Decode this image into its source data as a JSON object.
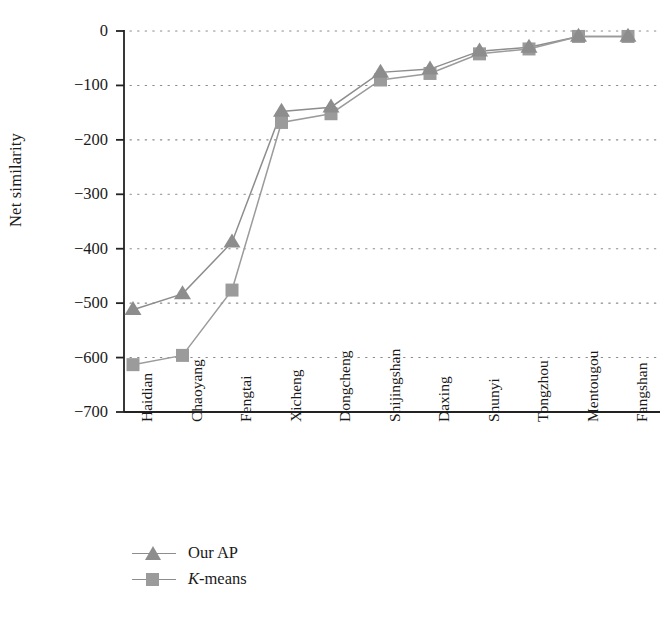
{
  "chart_data": {
    "type": "line",
    "title": "",
    "xlabel": "",
    "ylabel": "Net similarity",
    "categories": [
      "Haidian",
      "Chaoyang",
      "Fengtai",
      "Xicheng",
      "Dongcheng",
      "Shijingshan",
      "Daxing",
      "Shunyi",
      "Tongzhou",
      "Mentougou",
      "Fangshan"
    ],
    "series": [
      {
        "name": "Our AP",
        "marker": "triangle",
        "color": "#8d8d8d",
        "values": [
          -512,
          -483,
          -388,
          -148,
          -140,
          -76,
          -70,
          -37,
          -30,
          -10,
          -10
        ]
      },
      {
        "name": "K-means",
        "marker": "square",
        "color": "#9b9b9b",
        "values": [
          -613,
          -596,
          -476,
          -168,
          -152,
          -90,
          -78,
          -42,
          -33,
          -10,
          -10
        ]
      }
    ],
    "ylim": [
      -700,
      0
    ],
    "yticks": [
      0,
      -100,
      -200,
      -300,
      -400,
      -500,
      -600,
      -700
    ],
    "ytick_labels": [
      "0",
      "−100",
      "−200",
      "−300",
      "−400",
      "−500",
      "−600",
      "−700"
    ],
    "grid": true,
    "grid_style": "dotted",
    "legend_position": "bottom-left"
  },
  "legend": {
    "items": [
      {
        "label": "Our AP",
        "label_prefix": "",
        "label_rest": "Our AP"
      },
      {
        "label": "K-means",
        "label_prefix": "K",
        "label_rest": "-means"
      }
    ]
  }
}
